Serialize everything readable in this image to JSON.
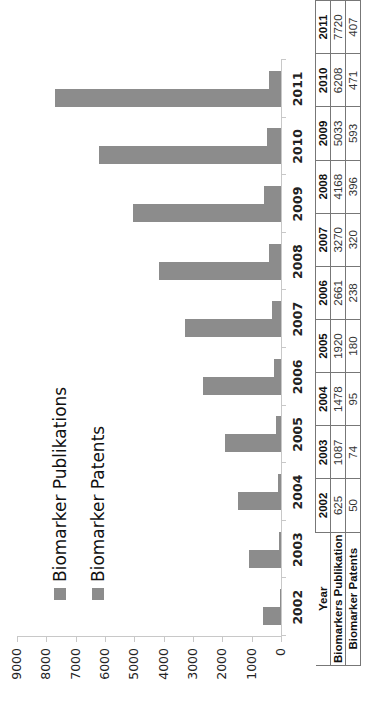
{
  "chart_data": {
    "type": "bar",
    "orientation": "rotated-90-ccw",
    "title": "",
    "xlabel": "",
    "ylabel": "",
    "categories": [
      "2002",
      "2003",
      "2004",
      "2005",
      "2006",
      "2007",
      "2008",
      "2009",
      "2010",
      "2011"
    ],
    "series": [
      {
        "name": "Biomarker Publikations",
        "color": "#8c8c8c",
        "values": [
          625,
          1087,
          1478,
          1920,
          2661,
          3270,
          4168,
          5033,
          6208,
          7720
        ]
      },
      {
        "name": "Biomarker Patents",
        "color": "#8c8c8c",
        "values": [
          50,
          74,
          95,
          180,
          238,
          320,
          396,
          593,
          471,
          407
        ]
      }
    ],
    "ylim": [
      0,
      9000
    ],
    "yticks": [
      "0",
      "1000",
      "2000",
      "3000",
      "4000",
      "5000",
      "6000",
      "7000",
      "8000",
      "9000"
    ],
    "grid": false,
    "legend_position": "top-left (rotated)",
    "data_table": {
      "header_label": "Year",
      "rows": [
        {
          "label": "Biomarkers Publikation",
          "values": [
            "625",
            "1087",
            "1478",
            "1920",
            "2661",
            "3270",
            "4168",
            "5033",
            "6208",
            "7720"
          ]
        },
        {
          "label": "Biomarker Patents",
          "values": [
            "50",
            "74",
            "95",
            "180",
            "238",
            "320",
            "396",
            "593",
            "471",
            "407"
          ]
        }
      ]
    }
  },
  "legend": {
    "items": [
      {
        "label": "Biomarker Publikations"
      },
      {
        "label": "Biomarker Patents"
      }
    ]
  },
  "colors": {
    "bar": "#8c8c8c",
    "axis": "#c8c8c8",
    "table_border": "#777777"
  }
}
